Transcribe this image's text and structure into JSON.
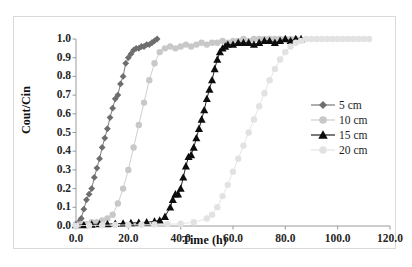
{
  "chart_data": {
    "type": "line",
    "title": "",
    "subtitle": "",
    "xlabel": "Time (h)",
    "ylabel": "Cout/Cin",
    "xlim": [
      0.0,
      120.0
    ],
    "ylim": [
      0.0,
      1.0
    ],
    "xticks": [
      "0.0",
      "20.0",
      "40.0",
      "60.0",
      "80.0",
      "100.0",
      "120.0"
    ],
    "xtick_values": [
      0,
      20,
      40,
      60,
      80,
      100,
      120
    ],
    "yticks": [
      "0.0",
      "0.1",
      "0.2",
      "0.3",
      "0.4",
      "0.5",
      "0.6",
      "0.7",
      "0.8",
      "0.9",
      "1.0"
    ],
    "ytick_values": [
      0.0,
      0.1,
      0.2,
      0.3,
      0.4,
      0.5,
      0.6,
      0.7,
      0.8,
      0.9,
      1.0
    ],
    "grid": false,
    "legend_position": "center-right",
    "series": [
      {
        "name": "5 cm",
        "color": "#6e6e6e",
        "marker": "diamond",
        "marker_size": 3.4,
        "x": [
          0.0,
          1.0,
          2.0,
          3.0,
          4.0,
          5.0,
          6.0,
          7.0,
          8.0,
          9.0,
          10.0,
          11.0,
          12.0,
          13.0,
          14.0,
          15.0,
          16.0,
          17.0,
          18.0,
          19.0,
          20.0,
          21.0,
          22.0,
          23.0,
          24.0,
          25.0,
          26.0,
          27.0,
          28.0,
          29.0,
          30.0,
          31.0
        ],
        "y": [
          0.01,
          0.02,
          0.04,
          0.09,
          0.14,
          0.17,
          0.2,
          0.26,
          0.31,
          0.36,
          0.42,
          0.47,
          0.52,
          0.58,
          0.63,
          0.68,
          0.7,
          0.76,
          0.8,
          0.87,
          0.9,
          0.92,
          0.94,
          0.95,
          0.95,
          0.96,
          0.96,
          0.97,
          0.97,
          0.98,
          0.99,
          1.0
        ]
      },
      {
        "name": "10 cm",
        "color": "#c8c8c8",
        "marker": "circle",
        "marker_size": 3.2,
        "x": [
          0.0,
          2.0,
          4.0,
          6.0,
          8.0,
          10.0,
          12.0,
          14.0,
          16.0,
          18.0,
          20.0,
          22.0,
          24.0,
          26.0,
          28.0,
          30.0,
          32.0,
          34.0,
          36.0,
          38.0,
          40.0,
          42.0,
          44.0,
          46.0,
          48.0,
          50.0,
          52.0,
          54.0,
          56.0,
          58.0,
          60.0,
          62.0,
          64.0,
          66.0,
          68.0,
          70.0,
          72.0,
          74.0,
          76.0,
          78.0,
          80.0,
          82.0,
          84.0
        ],
        "y": [
          0.01,
          0.01,
          0.01,
          0.02,
          0.02,
          0.03,
          0.04,
          0.06,
          0.12,
          0.2,
          0.3,
          0.42,
          0.54,
          0.66,
          0.78,
          0.87,
          0.93,
          0.95,
          0.96,
          0.95,
          0.96,
          0.97,
          0.96,
          0.97,
          0.98,
          0.97,
          0.98,
          0.98,
          0.99,
          0.98,
          0.99,
          0.99,
          1.0,
          0.99,
          1.0,
          1.0,
          1.0,
          1.0,
          1.0,
          1.0,
          1.0,
          1.0,
          1.0
        ]
      },
      {
        "name": "15 cm",
        "color": "#0d0d0d",
        "marker": "triangle",
        "marker_size": 3.6,
        "x": [
          0.0,
          3.0,
          6.0,
          9.0,
          12.0,
          15.0,
          18.0,
          21.0,
          24.0,
          27.0,
          30.0,
          32.0,
          34.0,
          36.0,
          37.0,
          38.0,
          39.0,
          40.0,
          41.0,
          42.0,
          43.0,
          44.0,
          45.0,
          46.0,
          47.0,
          48.0,
          49.0,
          50.0,
          51.0,
          52.0,
          53.0,
          54.0,
          55.0,
          56.0,
          57.0,
          58.0,
          60.0,
          62.0,
          64.0,
          66.0,
          68.0,
          70.0,
          72.0,
          74.0,
          76.0,
          78.0,
          80.0,
          82.0,
          84.0,
          86.0
        ],
        "y": [
          0.005,
          0.005,
          0.008,
          0.01,
          0.01,
          0.012,
          0.014,
          0.016,
          0.018,
          0.02,
          0.025,
          0.03,
          0.05,
          0.1,
          0.14,
          0.17,
          0.17,
          0.2,
          0.26,
          0.32,
          0.37,
          0.38,
          0.42,
          0.47,
          0.52,
          0.57,
          0.62,
          0.68,
          0.73,
          0.78,
          0.84,
          0.89,
          0.93,
          0.95,
          0.96,
          0.97,
          0.97,
          0.98,
          0.98,
          0.98,
          0.97,
          0.98,
          0.99,
          0.99,
          0.98,
          0.99,
          1.0,
          0.99,
          1.0,
          1.0
        ]
      },
      {
        "name": "20 cm",
        "color": "#e2e2e2",
        "marker": "circle",
        "marker_size": 3.2,
        "x": [
          0.0,
          5.0,
          10.0,
          15.0,
          20.0,
          25.0,
          30.0,
          35.0,
          40.0,
          45.0,
          50.0,
          52.0,
          54.0,
          56.0,
          58.0,
          60.0,
          62.0,
          64.0,
          66.0,
          68.0,
          70.0,
          72.0,
          74.0,
          76.0,
          78.0,
          80.0,
          82.0,
          84.0,
          86.0,
          88.0,
          90.0,
          92.0,
          94.0,
          96.0,
          98.0,
          100.0,
          102.0,
          104.0,
          106.0,
          108.0,
          110.0,
          112.0
        ],
        "y": [
          0.002,
          0.003,
          0.004,
          0.005,
          0.006,
          0.007,
          0.008,
          0.01,
          0.012,
          0.02,
          0.04,
          0.06,
          0.1,
          0.16,
          0.22,
          0.29,
          0.36,
          0.43,
          0.5,
          0.57,
          0.64,
          0.71,
          0.78,
          0.84,
          0.89,
          0.93,
          0.96,
          0.98,
          0.99,
          1.0,
          1.0,
          1.0,
          1.0,
          1.0,
          1.0,
          1.0,
          1.0,
          1.0,
          1.0,
          1.0,
          1.0,
          1.0
        ]
      }
    ]
  },
  "legend": {
    "items": [
      {
        "label": "5 cm"
      },
      {
        "label": "10 cm"
      },
      {
        "label": "15 cm"
      },
      {
        "label": "20 cm"
      }
    ]
  },
  "colors": {
    "series_5cm": "#6e6e6e",
    "series_10cm": "#c8c8c8",
    "series_15cm": "#0d0d0d",
    "series_20cm": "#e2e2e2",
    "axis": "#9a9a9a",
    "frame": "#d9d9d9",
    "text": "#1a1a1a",
    "background": "#ffffff"
  }
}
